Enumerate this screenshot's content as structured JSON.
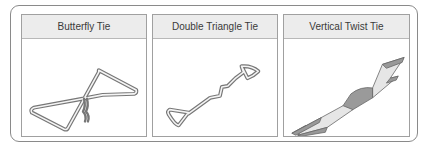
{
  "panels": [
    {
      "id": "butterfly",
      "title": "Butterfly Tie",
      "icon": "butterfly-tie-icon"
    },
    {
      "id": "double-triangle",
      "title": "Double Triangle Tie",
      "icon": "double-triangle-tie-icon"
    },
    {
      "id": "vertical-twist",
      "title": "Vertical Twist Tie",
      "icon": "vertical-twist-tie-icon"
    }
  ],
  "colors": {
    "wire": "#7a7a7a",
    "wire_light": "#f2f2f2",
    "twist_fill": "#9a9a9a",
    "twist_light": "#e6e6e6"
  }
}
